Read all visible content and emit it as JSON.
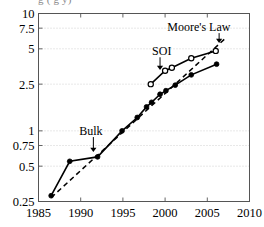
{
  "figure": {
    "clipped_title": "g  (  g   y)",
    "background": "#ffffff",
    "ink_color": "#000000",
    "grid_color": "#bdbdbd"
  },
  "chart_data": {
    "type": "line",
    "title": "",
    "xlabel": "",
    "ylabel": "",
    "xlim": [
      1985,
      2010
    ],
    "ylim": [
      0.25,
      10
    ],
    "yscale": "log",
    "grid": true,
    "legend": "none",
    "xticks": [
      1985,
      1990,
      1995,
      2000,
      2005,
      2010
    ],
    "xtick_labels": [
      "1985",
      "1990",
      "1995",
      "2000",
      "2005",
      "2010"
    ],
    "yticks": [
      0.25,
      0.5,
      0.75,
      1,
      2.5,
      5,
      7.5,
      10
    ],
    "ytick_labels": [
      "0.25",
      "0.5",
      "0.75",
      "1",
      "2.5",
      "5",
      "7.5",
      "10"
    ],
    "series": [
      {
        "name": "Bulk",
        "marker": "filled-circle",
        "linestyle": "solid",
        "x": [
          1986.5,
          1988.7,
          1992.0,
          1994.9,
          1996.7,
          1997.8,
          1998.4,
          1999.4,
          2000.1,
          2001.2,
          2003.1,
          2006.1
        ],
        "y": [
          0.28,
          0.55,
          0.6,
          1.0,
          1.3,
          1.6,
          1.75,
          2.05,
          2.2,
          2.45,
          3.0,
          3.7
        ]
      },
      {
        "name": "SOI",
        "marker": "open-circle",
        "linestyle": "solid",
        "x": [
          1998.3,
          2000.0,
          2000.8,
          2003.1,
          2006.0
        ],
        "y": [
          2.5,
          3.25,
          3.45,
          4.15,
          4.8
        ]
      },
      {
        "name": "Moore's Law",
        "marker": "none",
        "linestyle": "dashed",
        "x": [
          1986.5,
          2007.2
        ],
        "y": [
          0.27,
          6.2
        ]
      }
    ],
    "annotations": [
      {
        "text": "Bulk",
        "x": 1991.2,
        "y": 0.93,
        "arrow_to_x": 1991.5,
        "arrow_to_y": 0.66
      },
      {
        "text": "SOI",
        "x": 1999.6,
        "y": 4.45,
        "arrow_to_x": 1999.4,
        "arrow_to_y": 3.3
      },
      {
        "text": "Moore's Law",
        "x": 2004.0,
        "y": 7.15,
        "arrow_to_x": 2006.4,
        "arrow_to_y": 5.6
      }
    ]
  }
}
